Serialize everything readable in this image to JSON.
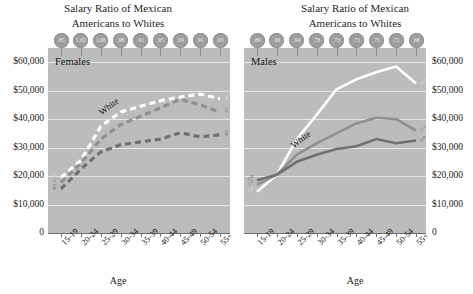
{
  "figure": {
    "panels": [
      {
        "id": "females",
        "title": "Salary Ratio of Mexican\nAmericans to Whites",
        "title_line1": "Salary Ratio of Mexican",
        "title_line2": "Americans to Whites",
        "panel_label": "Females",
        "series_label": "White",
        "axis_title": "Age",
        "gender_symbol": "♀"
      },
      {
        "id": "males",
        "title_line1": "Salary Ratio of Mexican",
        "title_line2": "Americans to Whites",
        "panel_label": "Males",
        "series_label": "White",
        "axis_title": "Age",
        "gender_symbol": "♂"
      }
    ]
  },
  "chart_data": [
    {
      "type": "line",
      "id": "females",
      "title": "Salary Ratio of Mexican Americans to Whites",
      "panel_label": "Females",
      "xlabel": "Age",
      "ylabel": "",
      "categories": [
        "15-19",
        "20-24",
        "25-29",
        "30-34",
        "35-39",
        "40-44",
        "45-49",
        "50-54",
        "55+"
      ],
      "ylim": [
        0,
        65000
      ],
      "yticks": [
        0,
        10000,
        20000,
        30000,
        40000,
        50000,
        60000
      ],
      "ytick_labels": [
        "0",
        "$10,000",
        "$20,000",
        "$30,000",
        "$40,000",
        "$50,000",
        "$60,000"
      ],
      "grid": true,
      "line_style": "dashed",
      "series": [
        {
          "name": "White",
          "color": "#ffffff",
          "values": [
            19500,
            25500,
            37500,
            42500,
            44500,
            46500,
            47800,
            48800,
            47200
          ]
        },
        {
          "name": "Mexican American",
          "color": "#8f8f8f",
          "values": [
            17800,
            24500,
            33000,
            38000,
            41000,
            44000,
            47000,
            45000,
            42500
          ]
        },
        {
          "name": "Other",
          "color": "#707070",
          "values": [
            15500,
            22500,
            28500,
            31000,
            32000,
            33000,
            35200,
            33800,
            34500
          ]
        }
      ],
      "ratio_badges": [
        ".85",
        "1.02",
        "1.06",
        ".98",
        ".91",
        ".95",
        ".99",
        ".91",
        ".93"
      ]
    },
    {
      "type": "line",
      "id": "males",
      "title": "Salary Ratio of Mexican Americans to Whites",
      "panel_label": "Males",
      "xlabel": "Age",
      "ylabel": "",
      "categories": [
        "15-19",
        "20-24",
        "25-29",
        "30-34",
        "35-39",
        "40-44",
        "45-49",
        "50-54",
        "55+"
      ],
      "ylim": [
        0,
        65000
      ],
      "yticks": [
        0,
        10000,
        20000,
        30000,
        40000,
        50000,
        60000
      ],
      "ytick_labels": [
        "0",
        "$10,000",
        "$20,000",
        "$30,000",
        "$40,000",
        "$50,000",
        "$60,000"
      ],
      "grid": true,
      "line_style": "solid",
      "series": [
        {
          "name": "White",
          "color": "#ffffff",
          "values": [
            14500,
            20500,
            33000,
            41500,
            50500,
            54000,
            56500,
            58500,
            52500
          ]
        },
        {
          "name": "Mexican American",
          "color": "#8f8f8f",
          "values": [
            17000,
            20500,
            27500,
            31500,
            35000,
            38500,
            40500,
            40000,
            36000
          ]
        },
        {
          "name": "Other",
          "color": "#707070",
          "values": [
            18500,
            20500,
            25000,
            27500,
            29500,
            30500,
            33000,
            31500,
            32500
          ]
        }
      ],
      "ratio_badges": [
        ".86",
        ".96",
        ".94",
        ".78",
        ".73",
        ".73",
        ".75",
        ".71",
        ".68"
      ]
    }
  ],
  "colors": {
    "plot_background": "#bcbcbc",
    "gridline": "#e6e6e6",
    "badge_fill": "#9d9d9d",
    "badge_text": "#efefef",
    "series_white": "#ffffff",
    "series_mid": "#8f8f8f",
    "series_dark": "#707070",
    "axis": "#6f6f6f",
    "text": "#1a1a1a"
  }
}
